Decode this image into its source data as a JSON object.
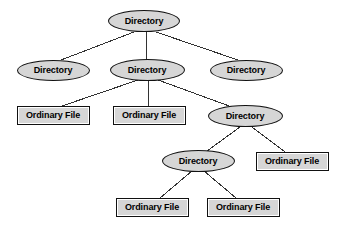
{
  "diagram": {
    "type": "tree",
    "background_color": "#ffffff",
    "node_fill_color": "#d6d6d6",
    "node_border_color": "#111111",
    "edge_color": "#333333",
    "label_color": "#000000",
    "node_shapes": {
      "directory": "ellipse",
      "file": "rect"
    },
    "nodes": [
      {
        "id": "n0",
        "label": "Directory",
        "kind": "directory",
        "shape": "ellipse",
        "cx": 144,
        "cy": 21,
        "w": 72,
        "h": 22,
        "level": 0
      },
      {
        "id": "n1",
        "label": "Directory",
        "kind": "directory",
        "shape": "ellipse",
        "cx": 53,
        "cy": 70,
        "w": 73,
        "h": 21,
        "level": 1
      },
      {
        "id": "n2",
        "label": "Directory",
        "kind": "directory",
        "shape": "ellipse",
        "cx": 147,
        "cy": 70,
        "w": 75,
        "h": 22,
        "level": 1
      },
      {
        "id": "n3",
        "label": "Directory",
        "kind": "directory",
        "shape": "ellipse",
        "cx": 246,
        "cy": 70,
        "w": 73,
        "h": 21,
        "level": 1
      },
      {
        "id": "n4",
        "label": "Ordinary File",
        "kind": "file",
        "shape": "rect",
        "cx": 53,
        "cy": 115,
        "w": 73,
        "h": 19,
        "level": 2
      },
      {
        "id": "n5",
        "label": "Ordinary File",
        "kind": "file",
        "shape": "rect",
        "cx": 149,
        "cy": 115,
        "w": 73,
        "h": 19,
        "level": 2
      },
      {
        "id": "n6",
        "label": "Directory",
        "kind": "directory",
        "shape": "ellipse",
        "cx": 245,
        "cy": 116,
        "w": 75,
        "h": 22,
        "level": 2
      },
      {
        "id": "n7",
        "label": "Directory",
        "kind": "directory",
        "shape": "ellipse",
        "cx": 198,
        "cy": 161,
        "w": 73,
        "h": 22,
        "level": 3
      },
      {
        "id": "n8",
        "label": "Ordinary File",
        "kind": "file",
        "shape": "rect",
        "cx": 292,
        "cy": 161,
        "w": 73,
        "h": 19,
        "level": 3
      },
      {
        "id": "n9",
        "label": "Ordinary File",
        "kind": "file",
        "shape": "rect",
        "cx": 152,
        "cy": 207,
        "w": 73,
        "h": 19,
        "level": 4
      },
      {
        "id": "n10",
        "label": "Ordinary File",
        "kind": "file",
        "shape": "rect",
        "cx": 243,
        "cy": 207,
        "w": 73,
        "h": 19,
        "level": 4
      }
    ],
    "edges": [
      {
        "from": "n0",
        "to": "n1",
        "x1": 134,
        "y1": 32,
        "x2": 61,
        "y2": 60
      },
      {
        "from": "n0",
        "to": "n2",
        "x1": 146,
        "y1": 32,
        "x2": 147,
        "y2": 59
      },
      {
        "from": "n0",
        "to": "n3",
        "x1": 156,
        "y1": 32,
        "x2": 238,
        "y2": 60
      },
      {
        "from": "n2",
        "to": "n4",
        "x1": 138,
        "y1": 80,
        "x2": 62,
        "y2": 106
      },
      {
        "from": "n2",
        "to": "n5",
        "x1": 148,
        "y1": 80,
        "x2": 149,
        "y2": 106
      },
      {
        "from": "n2",
        "to": "n6",
        "x1": 158,
        "y1": 80,
        "x2": 232,
        "y2": 107
      },
      {
        "from": "n6",
        "to": "n7",
        "x1": 240,
        "y1": 127,
        "x2": 207,
        "y2": 151
      },
      {
        "from": "n6",
        "to": "n8",
        "x1": 252,
        "y1": 127,
        "x2": 285,
        "y2": 152
      },
      {
        "from": "n7",
        "to": "n9",
        "x1": 192,
        "y1": 171,
        "x2": 160,
        "y2": 198
      },
      {
        "from": "n7",
        "to": "n10",
        "x1": 204,
        "y1": 171,
        "x2": 236,
        "y2": 198
      }
    ]
  }
}
